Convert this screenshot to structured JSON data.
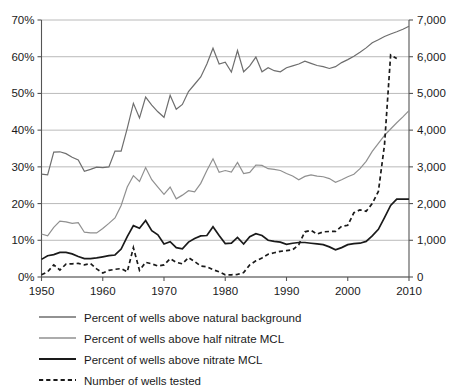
{
  "chart_data": {
    "type": "line",
    "title": "",
    "xlabel": "",
    "ylabel": "",
    "x_start": 1950,
    "x_end": 2010,
    "xlim": [
      1950,
      2010
    ],
    "x_ticks": [
      "1950",
      "1960",
      "1970",
      "1980",
      "1990",
      "2000",
      "2010"
    ],
    "x_tick_values": [
      1950,
      1960,
      1970,
      1980,
      1990,
      2000,
      2010
    ],
    "left_axis": {
      "ylim": [
        0,
        70
      ],
      "ticks": [
        "0%",
        "10%",
        "20%",
        "30%",
        "40%",
        "50%",
        "60%",
        "70%"
      ],
      "tick_values": [
        0,
        10,
        20,
        30,
        40,
        50,
        60,
        70
      ],
      "unit": "%"
    },
    "right_axis": {
      "ylim": [
        0,
        7000
      ],
      "ticks": [
        "0",
        "1,000",
        "2,000",
        "3,000",
        "4,000",
        "5,000",
        "6,000",
        "7,000"
      ],
      "tick_values": [
        0,
        1000,
        2000,
        3000,
        4000,
        5000,
        6000,
        7000
      ],
      "unit": "wells"
    },
    "grid": true,
    "legend_position": "below",
    "series": [
      {
        "name": "Percent of wells above natural background",
        "axis": "left",
        "style": "solid",
        "color": "#6e6e6e",
        "width": 1.2,
        "x": [
          1950,
          1951,
          1952,
          1953,
          1954,
          1955,
          1956,
          1957,
          1958,
          1959,
          1960,
          1961,
          1962,
          1963,
          1964,
          1965,
          1966,
          1967,
          1968,
          1969,
          1970,
          1971,
          1972,
          1973,
          1974,
          1975,
          1976,
          1977,
          1978,
          1979,
          1980,
          1981,
          1982,
          1983,
          1984,
          1985,
          1986,
          1987,
          1988,
          1989,
          1990,
          1991,
          1992,
          1993,
          1994,
          1995,
          1996,
          1997,
          1998,
          1999,
          2000,
          2001,
          2002,
          2003,
          2004,
          2005,
          2006,
          2007,
          2008,
          2009,
          2010
        ],
        "values": [
          28.0,
          27.8,
          34.0,
          34.1,
          33.6,
          32.6,
          31.9,
          28.8,
          29.3,
          29.9,
          29.8,
          30.0,
          34.3,
          34.3,
          40.5,
          47.3,
          43.3,
          49.0,
          46.8,
          45.0,
          43.5,
          49.5,
          45.7,
          47.0,
          50.5,
          52.5,
          54.5,
          58.0,
          62.3,
          58.0,
          58.5,
          55.8,
          61.7,
          55.9,
          57.5,
          59.9,
          55.9,
          57.0,
          56.2,
          55.9,
          57.0,
          57.5,
          58.0,
          58.8,
          58.2,
          57.6,
          57.3,
          56.8,
          57.3,
          58.4,
          59.2,
          60.1,
          61.2,
          62.4,
          63.8,
          64.6,
          65.5,
          66.2,
          66.8,
          67.5,
          68.3
        ]
      },
      {
        "name": "Percent of wells above half nitrate MCL",
        "axis": "left",
        "style": "solid",
        "color": "#909090",
        "width": 1.2,
        "x": [
          1950,
          1951,
          1952,
          1953,
          1954,
          1955,
          1956,
          1957,
          1958,
          1959,
          1960,
          1961,
          1962,
          1963,
          1964,
          1965,
          1966,
          1967,
          1968,
          1969,
          1970,
          1971,
          1972,
          1973,
          1974,
          1975,
          1976,
          1977,
          1978,
          1979,
          1980,
          1981,
          1982,
          1983,
          1984,
          1985,
          1986,
          1987,
          1988,
          1989,
          1990,
          1991,
          1992,
          1993,
          1994,
          1995,
          1996,
          1997,
          1998,
          1999,
          2000,
          2001,
          2002,
          2003,
          2004,
          2005,
          2006,
          2007,
          2008,
          2009,
          2010
        ],
        "values": [
          11.7,
          11.2,
          13.5,
          15.2,
          15.0,
          14.6,
          14.8,
          12.2,
          12.0,
          12.0,
          13.2,
          14.6,
          16.1,
          19.5,
          24.5,
          27.6,
          26.0,
          29.8,
          26.5,
          24.5,
          22.5,
          24.5,
          21.3,
          22.3,
          23.5,
          23.2,
          25.5,
          29.0,
          32.2,
          28.5,
          29.0,
          28.6,
          31.2,
          28.2,
          28.5,
          30.5,
          30.4,
          29.5,
          29.3,
          29.0,
          28.2,
          27.5,
          26.5,
          27.4,
          27.8,
          27.5,
          27.3,
          26.8,
          25.8,
          26.5,
          27.3,
          28.0,
          29.5,
          31.5,
          34.2,
          36.4,
          38.6,
          40.3,
          42.0,
          43.6,
          45.3
        ]
      },
      {
        "name": "Percent of wells above nitrate MCL",
        "axis": "left",
        "style": "solid",
        "color": "#1a1a1a",
        "width": 1.7,
        "x": [
          1950,
          1951,
          1952,
          1953,
          1954,
          1955,
          1956,
          1957,
          1958,
          1959,
          1960,
          1961,
          1962,
          1963,
          1964,
          1965,
          1966,
          1967,
          1968,
          1969,
          1970,
          1971,
          1972,
          1973,
          1974,
          1975,
          1976,
          1977,
          1978,
          1979,
          1980,
          1981,
          1982,
          1983,
          1984,
          1985,
          1986,
          1987,
          1988,
          1989,
          1990,
          1991,
          1992,
          1993,
          1994,
          1995,
          1996,
          1997,
          1998,
          1999,
          2000,
          2001,
          2002,
          2003,
          2004,
          2005,
          2006,
          2007,
          2008,
          2009,
          2010
        ],
        "values": [
          4.8,
          5.8,
          6.1,
          6.7,
          6.7,
          6.3,
          5.6,
          5.0,
          5.0,
          5.2,
          5.5,
          5.8,
          6.0,
          7.6,
          11.0,
          14.0,
          13.3,
          15.4,
          12.6,
          11.5,
          9.0,
          9.6,
          8.0,
          7.7,
          9.5,
          10.5,
          11.2,
          11.3,
          13.7,
          11.3,
          9.1,
          9.2,
          10.8,
          9.0,
          11.0,
          11.8,
          11.3,
          10.0,
          9.7,
          9.5,
          8.9,
          9.2,
          9.4,
          9.4,
          9.2,
          9.0,
          8.8,
          8.2,
          7.4,
          8.0,
          8.8,
          9.1,
          9.2,
          9.7,
          11.2,
          13.0,
          16.2,
          19.5,
          21.2,
          21.2,
          21.2
        ]
      },
      {
        "name": "Number of wells tested",
        "axis": "right",
        "style": "dashed",
        "color": "#1a1a1a",
        "width": 1.7,
        "x": [
          1950,
          1951,
          1952,
          1953,
          1954,
          1955,
          1956,
          1957,
          1958,
          1959,
          1960,
          1961,
          1962,
          1963,
          1964,
          1965,
          1966,
          1967,
          1968,
          1969,
          1970,
          1971,
          1972,
          1973,
          1974,
          1975,
          1976,
          1977,
          1978,
          1979,
          1980,
          1981,
          1982,
          1983,
          1984,
          1985,
          1986,
          1987,
          1988,
          1989,
          1990,
          1991,
          1992,
          1993,
          1994,
          1995,
          1996,
          1997,
          1998,
          1999,
          2000,
          2001,
          2002,
          2003,
          2004,
          2005,
          2006,
          2007,
          2008
        ],
        "values": [
          60,
          140,
          330,
          190,
          350,
          360,
          370,
          330,
          370,
          220,
          110,
          180,
          210,
          230,
          140,
          800,
          180,
          400,
          360,
          300,
          330,
          500,
          400,
          360,
          530,
          420,
          300,
          280,
          200,
          140,
          60,
          60,
          70,
          120,
          330,
          440,
          520,
          620,
          660,
          700,
          720,
          740,
          880,
          1230,
          1270,
          1170,
          1230,
          1240,
          1240,
          1380,
          1410,
          1750,
          1830,
          1790,
          2000,
          2330,
          3600,
          6050,
          5950
        ]
      }
    ]
  },
  "legend": {
    "items": [
      {
        "label": "Percent of wells above natural background",
        "style": "solid",
        "color": "#6e6e6e",
        "width": 1.3
      },
      {
        "label": "Percent of wells above half nitrate MCL",
        "style": "solid",
        "color": "#909090",
        "width": 1.3
      },
      {
        "label": "Percent of wells above nitrate MCL",
        "style": "solid",
        "color": "#1a1a1a",
        "width": 2.0
      },
      {
        "label": "Number of wells tested",
        "style": "dashed",
        "color": "#1a1a1a",
        "width": 1.8
      }
    ]
  }
}
